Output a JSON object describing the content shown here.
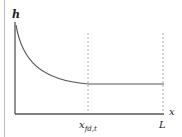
{
  "diagram": {
    "y_axis_label": "h",
    "x_axis_label": "x",
    "markers": [
      {
        "name": "x-fd-t",
        "main": "x",
        "sub": "fd,t"
      },
      {
        "name": "length",
        "main": "L"
      }
    ],
    "curve_description": "h decays from large value near x=0 to a constant at x_fd,t, then stays constant to L",
    "colors": {
      "axis": "#555555",
      "curve": "#555555",
      "dashed": "#9a9a9a",
      "frame": "#bbbbbb"
    }
  }
}
